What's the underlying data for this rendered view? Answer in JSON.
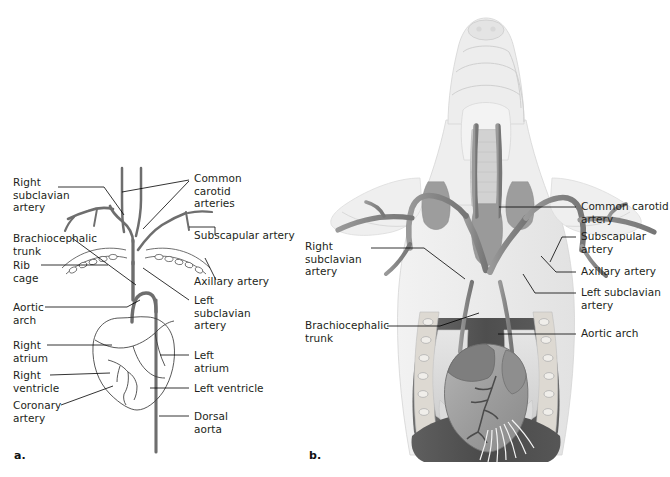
{
  "figure": {
    "panels": [
      {
        "id": "a",
        "marker": "a.",
        "type": "schematic-line-drawing"
      },
      {
        "id": "b",
        "marker": "b.",
        "type": "shaded-anatomical-illustration"
      }
    ]
  },
  "colors": {
    "background": "#ffffff",
    "text": "#231f20",
    "leader_line": "#000000",
    "vessel_schematic": "#6e6e6e",
    "outline_schematic": "#3a3a3a",
    "body_silhouette": "#ebebeb",
    "body_silhouette_edge": "#cfcfcf",
    "vessel_shaded": "#8a8a8a",
    "vessel_shaded_dark": "#6f6f6f",
    "thoracic_cavity_dark": "#5b5b5b",
    "thoracic_cavity_darker": "#474747",
    "lung_light": "#d8d8d8",
    "heart_fill": "#a0a0a0",
    "heart_atrium": "#7e7e7e",
    "rib_fill": "#e4e4e4",
    "thymus_gland": "#9a9a9a",
    "trachea": "#c8c8c8"
  },
  "panel_a": {
    "marker": "a.",
    "labels_left": [
      {
        "name": "right-subclavian-artery",
        "text": "Right\nsubclavian\nartery"
      },
      {
        "name": "brachiocephalic-trunk",
        "text": "Brachiocephalic\ntrunk"
      },
      {
        "name": "rib-cage",
        "text": "Rib\ncage"
      },
      {
        "name": "aortic-arch",
        "text": "Aortic\narch"
      },
      {
        "name": "right-atrium",
        "text": "Right\natrium"
      },
      {
        "name": "right-ventricle",
        "text": "Right\nventricle"
      },
      {
        "name": "coronary-artery",
        "text": "Coronary\nartery"
      }
    ],
    "labels_right": [
      {
        "name": "common-carotid-arteries",
        "text": "Common\ncarotid\narteries"
      },
      {
        "name": "subscapular-artery",
        "text": "Subscapular artery"
      },
      {
        "name": "axillary-artery",
        "text": "Axillary artery"
      },
      {
        "name": "left-subclavian-artery",
        "text": "Left\nsubclavian\nartery"
      },
      {
        "name": "left-atrium",
        "text": "Left\natrium"
      },
      {
        "name": "left-ventricle",
        "text": "Left ventricle"
      },
      {
        "name": "dorsal-aorta",
        "text": "Dorsal\naorta"
      }
    ]
  },
  "panel_b": {
    "marker": "b.",
    "labels_left": [
      {
        "name": "right-subclavian-artery",
        "text": "Right\nsubclavian\nartery"
      },
      {
        "name": "brachiocephalic-trunk",
        "text": "Brachiocephalic\ntrunk"
      }
    ],
    "labels_right": [
      {
        "name": "common-carotid-artery",
        "text": "Common carotid\nartery"
      },
      {
        "name": "subscapular-artery",
        "text": "Subscapular\nartery"
      },
      {
        "name": "axillary-artery",
        "text": "Axillary artery"
      },
      {
        "name": "left-subclavian-artery",
        "text": "Left subclavian\nartery"
      },
      {
        "name": "aortic-arch",
        "text": "Aortic arch"
      }
    ]
  }
}
